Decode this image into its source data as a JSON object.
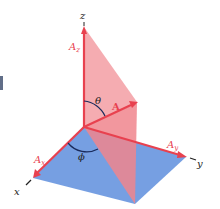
{
  "diagram": {
    "axes": {
      "x": "x",
      "y": "y",
      "z": "z"
    },
    "vector": {
      "label": "A",
      "components": {
        "x": "Ax",
        "y": "Ay",
        "z": "Az"
      },
      "component_subscripts": {
        "x": "x",
        "y": "y",
        "z": "z"
      },
      "component_base": "A"
    },
    "angles": {
      "polar": "θ",
      "azimuth": "ϕ"
    },
    "colors": {
      "vector_red": "#e8414f",
      "vertical_plane_pink": "#f19aa0",
      "horizontal_plane_blue": "#6f9ae0",
      "angle_arc": "#1a2b5c",
      "axis_text": "#222222",
      "edge_marker": "#3a4a6a"
    }
  }
}
